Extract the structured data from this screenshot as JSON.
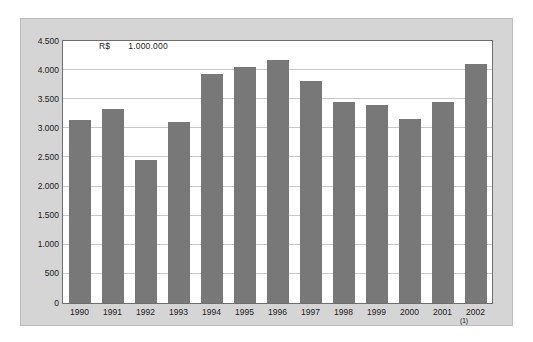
{
  "chart_data": {
    "type": "bar",
    "title": "",
    "subtitle": "",
    "units_currency": "R$",
    "units_multiplier": "1.000.000",
    "xlabel": "",
    "ylabel": "",
    "categories": [
      "1990",
      "1991",
      "1992",
      "1993",
      "1994",
      "1995",
      "1996",
      "1997",
      "1998",
      "1999",
      "2000",
      "2001",
      "2002"
    ],
    "values": [
      3150,
      3330,
      2450,
      3110,
      3940,
      4050,
      4170,
      3820,
      3450,
      3400,
      3160,
      3460,
      4100
    ],
    "ylim": [
      0,
      4500
    ],
    "yticks": [
      0,
      500,
      1000,
      1500,
      2000,
      2500,
      3000,
      3500,
      4000,
      4500
    ],
    "ytick_labels": [
      "0",
      "500",
      "1.000",
      "1.500",
      "2.000",
      "2.500",
      "3.000",
      "3.500",
      "4.000",
      "4.500"
    ],
    "grid": true,
    "legend": "none",
    "bar_color": "#787878",
    "plot_background": "#ffffff",
    "panel_background": "#d5d5d5",
    "gridline_color": "#c9c9c9",
    "axis_color": "#6e6e6e",
    "annotations": [
      {
        "category": "2002",
        "note": "(1)"
      }
    ]
  },
  "axis": {
    "y_labels": [
      "4.500",
      "4.000",
      "3.500",
      "3.000",
      "2.500",
      "2.000",
      "1.500",
      "1.000",
      "500",
      "0"
    ],
    "x_labels": [
      "1990",
      "1991",
      "1992",
      "1993",
      "1994",
      "1995",
      "1996",
      "1997",
      "1998",
      "1999",
      "2000",
      "2001",
      "2002"
    ],
    "x_footnotes": [
      "",
      "",
      "",
      "",
      "",
      "",
      "",
      "",
      "",
      "",
      "",
      "",
      "(1)"
    ]
  },
  "units": {
    "currency": "R$",
    "value": "1.000.000"
  }
}
